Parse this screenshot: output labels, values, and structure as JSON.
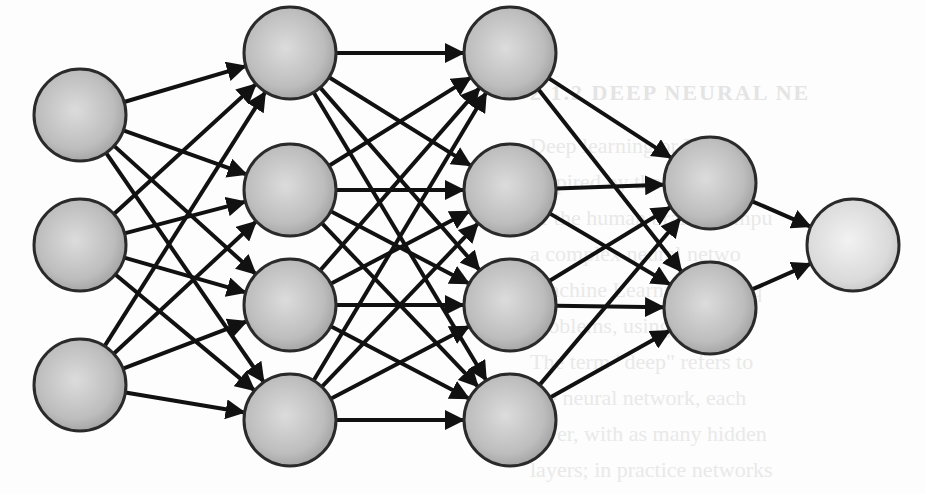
{
  "background": {
    "heading": "2.1.2  DEEP NEURAL NE",
    "lines": [
      "Deep learning or DN",
      "inspired by the structure",
      "of the human brain. Compu",
      "a complex neural netwo",
      "Machine Learning techniq",
      "problems, using model",
      "The term \"deep\" refers to",
      "the neural network, each",
      "layer, with as many hidden",
      "layers; in practice networks"
    ]
  },
  "diagram": {
    "node_fill": "#b4b4b4",
    "output_fill": "#d8d8d8",
    "stroke": "#111111",
    "node_radius": 46,
    "layers": [
      {
        "name": "input-layer",
        "x": 80,
        "nodes": [
          115,
          245,
          385
        ]
      },
      {
        "name": "hidden-layer-1",
        "x": 290,
        "nodes": [
          53,
          190,
          305,
          420
        ]
      },
      {
        "name": "hidden-layer-2",
        "x": 510,
        "nodes": [
          53,
          190,
          305,
          420
        ]
      },
      {
        "name": "hidden-layer-3",
        "x": 710,
        "nodes": [
          183,
          308
        ]
      },
      {
        "name": "output-layer",
        "x": 853,
        "nodes": [
          245
        ]
      }
    ]
  }
}
